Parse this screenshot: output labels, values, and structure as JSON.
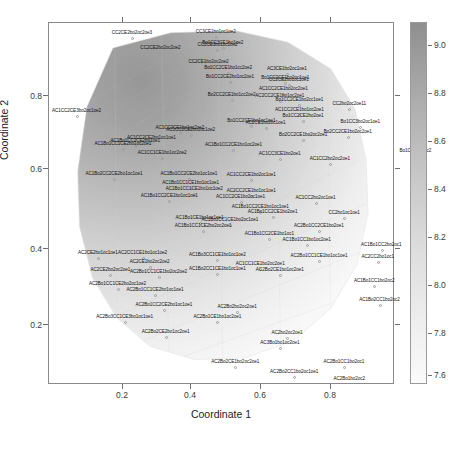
{
  "axes": {
    "xlabel": "Coordinate 1",
    "ylabel": "Coordinate 2",
    "xticks": [
      "0.2",
      "0.4",
      "0.6",
      "0.8"
    ],
    "yticks": [
      "0.2",
      "0.4",
      "0.6",
      "0.8"
    ]
  },
  "colorbar": {
    "ticks": [
      "9.0",
      "8.8",
      "8.6",
      "8.4",
      "8.2",
      "8.0",
      "7.8",
      "7.6"
    ],
    "min": 7.6,
    "max": 9.1,
    "low_color": "#fbfbfb",
    "high_color": "#8f8f8f"
  },
  "chart_data": {
    "type": "heatmap",
    "title": "",
    "xlabel": "Coordinate 1",
    "ylabel": "Coordinate 2",
    "xlim": [
      0.03,
      1.0
    ],
    "ylim": [
      0.08,
      1.0
    ],
    "grid": false,
    "legend": "colorbar-right",
    "colorbar_range": [
      7.6,
      9.1
    ],
    "colorbar_ticks": [
      9.0,
      8.8,
      8.6,
      8.4,
      8.2,
      8.0,
      7.8,
      7.6
    ],
    "surface_description": "smooth grayscale response surface over an irregular convex blob; darkest (highest, ~9.1) in the upper-left lobe, fading to lightest (~7.6) toward the lower-right",
    "points": [
      {
        "x": 0.265,
        "y": 0.96,
        "label": "CC2CE2bo2oc2oe3",
        "value": 9.05
      },
      {
        "x": 0.5,
        "y": 0.962,
        "label": "CC3CE1bo1oc1oe2",
        "value": 9.02
      },
      {
        "x": 0.52,
        "y": 0.935,
        "label": "Bo1CC3CE1bo1oe2",
        "value": 9.0
      },
      {
        "x": 0.505,
        "y": 0.93,
        "label": "CC2CE3bo1oc1oe2",
        "value": 8.99
      },
      {
        "x": 0.345,
        "y": 0.922,
        "label": "CC2CE2bo2oc2oe2",
        "value": 9.01
      },
      {
        "x": 0.48,
        "y": 0.885,
        "label": "CC2CE1bo2oc2oe2",
        "value": 8.95
      },
      {
        "x": 0.535,
        "y": 0.87,
        "label": "Bo1CC2CE1bo1cc2oe2",
        "value": 8.94
      },
      {
        "x": 0.7,
        "y": 0.868,
        "label": "AC3CE1bo2oc1oe1",
        "value": 8.9
      },
      {
        "x": 0.54,
        "y": 0.848,
        "label": "Bo1CC2CE2bo1oc2oe1",
        "value": 8.92
      },
      {
        "x": 0.695,
        "y": 0.845,
        "label": "Bo1CC2CE1bo2oc1oe1",
        "value": 8.88
      },
      {
        "x": 0.705,
        "y": 0.84,
        "label": "CC2CE2bo1oc1oe1",
        "value": 8.89
      },
      {
        "x": 0.69,
        "y": 0.818,
        "label": "AC1CC2CE1bo2oc2oe1",
        "value": 8.86
      },
      {
        "x": 0.545,
        "y": 0.803,
        "label": "Bo2CC2CE1bo1cc2oe2",
        "value": 8.87
      },
      {
        "x": 0.68,
        "y": 0.8,
        "label": "AC2CC2CE1bo1oc2oe1",
        "value": 8.85
      },
      {
        "x": 0.735,
        "y": 0.788,
        "label": "Bo1CC2CE1bo2cc1oe1",
        "value": 8.83
      },
      {
        "x": 0.875,
        "y": 0.778,
        "label": "CC2bo2oc2oe11",
        "value": 8.8
      },
      {
        "x": 0.735,
        "y": 0.763,
        "label": "AC1CC2CE1bo1oc2oe1",
        "value": 8.81
      },
      {
        "x": 0.745,
        "y": 0.748,
        "label": "Bo1CC2CE2bo2oe1",
        "value": 8.79
      },
      {
        "x": 0.11,
        "y": 0.76,
        "label": "AC1CC2CE3bo2oc1oe2",
        "value": 8.86
      },
      {
        "x": 0.6,
        "y": 0.735,
        "label": "Bo1CC2CE1bo1oc1oe1",
        "value": 8.78
      },
      {
        "x": 0.64,
        "y": 0.73,
        "label": "AC2CE1bo2oc1oe1",
        "value": 8.77
      },
      {
        "x": 0.905,
        "y": 0.732,
        "label": "Bo1CC3bo2oc1oe1",
        "value": 8.7
      },
      {
        "x": 0.4,
        "y": 0.718,
        "label": "AC1CC2CE1bo1oc2oe2",
        "value": 8.76
      },
      {
        "x": 0.43,
        "y": 0.712,
        "label": "AC1CC2CE2bo1oc1oe2",
        "value": 8.75
      },
      {
        "x": 0.87,
        "y": 0.708,
        "label": "Bo2CC2CE1bo2oc2oe1",
        "value": 8.68
      },
      {
        "x": 0.745,
        "y": 0.7,
        "label": "Bo2CC2CE1bo2oc2oe1",
        "value": 8.69
      },
      {
        "x": 0.32,
        "y": 0.693,
        "label": "AC1CC2CE2bo1oc1oe1",
        "value": 8.74
      },
      {
        "x": 0.275,
        "y": 0.686,
        "label": "AC1Bo1CC2CE2bo1oe1",
        "value": 8.73
      },
      {
        "x": 0.24,
        "y": 0.678,
        "label": "AC1Bo1CC1CE2bo1oc2oe1",
        "value": 8.72
      },
      {
        "x": 0.55,
        "y": 0.675,
        "label": "AC1Bo1CC2CE1bo1oc2oe1",
        "value": 8.7
      },
      {
        "x": 1.06,
        "y": 0.66,
        "label": "Bo1CC2bo2oc2",
        "value": 8.55
      },
      {
        "x": 0.35,
        "y": 0.655,
        "label": "AC1CC1CE1bo1oc2oe2",
        "value": 8.68
      },
      {
        "x": 0.68,
        "y": 0.652,
        "label": "AC1CC3CE1bo2oe1",
        "value": 8.62
      },
      {
        "x": 0.82,
        "y": 0.64,
        "label": "AC1CC2bo2oc2oe1",
        "value": 8.58
      },
      {
        "x": 0.215,
        "y": 0.602,
        "label": "AC1Bo2CC2CE2bo1oc1oe1",
        "value": 8.64
      },
      {
        "x": 0.425,
        "y": 0.6,
        "label": "AC1Bo1CC2CE2bo1oc1oe1",
        "value": 8.62
      },
      {
        "x": 0.6,
        "y": 0.598,
        "label": "AC1CC2CE1bo2oc1oe1",
        "value": 8.6
      },
      {
        "x": 0.43,
        "y": 0.578,
        "label": "AC1Bo1CC1CE1bo1oc1oe1",
        "value": 8.59
      },
      {
        "x": 0.44,
        "y": 0.562,
        "label": "AC1Bo1CC1CE1bo1oc1oe2",
        "value": 8.58
      },
      {
        "x": 0.6,
        "y": 0.558,
        "label": "AC2CC2CE1bo1oc1oe1",
        "value": 8.55
      },
      {
        "x": 0.37,
        "y": 0.545,
        "label": "AC1Bo1CC2CE1bo1oc1oe1",
        "value": 8.56
      },
      {
        "x": 0.57,
        "y": 0.542,
        "label": "AC1CC2CE1bo2oc1oe1",
        "value": 8.54
      },
      {
        "x": 0.78,
        "y": 0.54,
        "label": "AC1CC2bo2oc1oe1",
        "value": 8.45
      },
      {
        "x": 0.625,
        "y": 0.518,
        "label": "AC1Bo1CC2CE1bo1oc1oe1",
        "value": 8.5
      },
      {
        "x": 0.66,
        "y": 0.505,
        "label": "AC1Bo1CC2CE1bo2oe1",
        "value": 8.48
      },
      {
        "x": 0.86,
        "y": 0.502,
        "label": "CC2bo1oc1oe1",
        "value": 8.4
      },
      {
        "x": 0.455,
        "y": 0.49,
        "label": "AC1Bo1CE1bo1oc1oe1",
        "value": 8.49
      },
      {
        "x": 0.54,
        "y": 0.485,
        "label": "AC1Bo1CC1CE1bo2oc1oe1",
        "value": 8.47
      },
      {
        "x": 0.465,
        "y": 0.468,
        "label": "AC1Bo1CC1CE2bo2oc2oe1",
        "value": 8.46
      },
      {
        "x": 0.79,
        "y": 0.47,
        "label": "AC2Bo1CC2CE1bo2oe1",
        "value": 8.38
      },
      {
        "x": 0.65,
        "y": 0.448,
        "label": "AC1Bo1CC2CE1bo1oc1",
        "value": 8.4
      },
      {
        "x": 0.755,
        "y": 0.432,
        "label": "AC1Bo1CC1bo1oc2oe1",
        "value": 8.34
      },
      {
        "x": 0.965,
        "y": 0.42,
        "label": "AC1Bo1CC2bo2oc1",
        "value": 8.22
      },
      {
        "x": 0.17,
        "y": 0.4,
        "label": "AC2CE2bo1oc1oe1",
        "value": 8.38
      },
      {
        "x": 0.295,
        "y": 0.4,
        "label": "AC2CC1CE1bo1oc1oe2",
        "value": 8.36
      },
      {
        "x": 0.505,
        "y": 0.395,
        "label": "AC1Bo3CC1CE1bo1oc1oe2",
        "value": 8.32
      },
      {
        "x": 0.79,
        "y": 0.392,
        "label": "AC2Bo1CC1CE1bo1oc1oe1",
        "value": 8.25
      },
      {
        "x": 0.955,
        "y": 0.39,
        "label": "AC2CC2bo1oc1",
        "value": 8.18
      },
      {
        "x": 0.315,
        "y": 0.378,
        "label": "AC2CE1bo2oc2oe2",
        "value": 8.34
      },
      {
        "x": 0.625,
        "y": 0.372,
        "label": "AC1CC1CE1bo2oc2oe1",
        "value": 8.28
      },
      {
        "x": 0.505,
        "y": 0.36,
        "label": "AC1Bo2CC1CE1bo1oc1oe1",
        "value": 8.27
      },
      {
        "x": 0.68,
        "y": 0.358,
        "label": "AC2Bo2CE1bo1oc2oe1",
        "value": 8.22
      },
      {
        "x": 0.205,
        "y": 0.358,
        "label": "AC2CE2bo2oc2oe1",
        "value": 8.32
      },
      {
        "x": 0.34,
        "y": 0.352,
        "label": "AC2Bo1CC1CE1bo2oc2oe2",
        "value": 8.3
      },
      {
        "x": 0.945,
        "y": 0.33,
        "label": "AC1Bo1CC1bo2oc2",
        "value": 8.05
      },
      {
        "x": 0.225,
        "y": 0.322,
        "label": "AC2Bo1CC1CE2bo2oc1oe2",
        "value": 8.26
      },
      {
        "x": 0.33,
        "y": 0.305,
        "label": "AC2Bo1CC1CE2bo1oc1oe1",
        "value": 8.22
      },
      {
        "x": 0.96,
        "y": 0.282,
        "label": "AC1Bo2CC1bo2oc2",
        "value": 7.96
      },
      {
        "x": 0.355,
        "y": 0.268,
        "label": "AC2Bo1CC2CE2bo1oc1oe1",
        "value": 8.15
      },
      {
        "x": 0.56,
        "y": 0.262,
        "label": "AC2Bo2bo2oc2oe1",
        "value": 8.05
      },
      {
        "x": 0.245,
        "y": 0.238,
        "label": "AC2Bo3CC1CE3bo1oc1oe1",
        "value": 8.12
      },
      {
        "x": 0.505,
        "y": 0.238,
        "label": "AC2Bo1CE1bo1oc2oe1",
        "value": 8.02
      },
      {
        "x": 0.36,
        "y": 0.2,
        "label": "AC2Bo2CE2bo1oc2oe1",
        "value": 8.0
      },
      {
        "x": 0.7,
        "y": 0.198,
        "label": "AC2bo2oc2oe1",
        "value": 7.88
      },
      {
        "x": 0.68,
        "y": 0.172,
        "label": "AC3Bo1bo1oc2oe1",
        "value": 7.84
      },
      {
        "x": 0.555,
        "y": 0.122,
        "label": "AC2Bo2CE1bo2oc2oe1",
        "value": 7.8
      },
      {
        "x": 0.86,
        "y": 0.122,
        "label": "AC2Bo1CC1bo2oc1",
        "value": 7.72
      },
      {
        "x": 0.72,
        "y": 0.098,
        "label": "AC2Bo2CC1bo2oc1oe1",
        "value": 7.7
      },
      {
        "x": 0.875,
        "y": 0.08,
        "label": "AC2Bo1bo2oc2",
        "value": 7.65
      }
    ]
  }
}
